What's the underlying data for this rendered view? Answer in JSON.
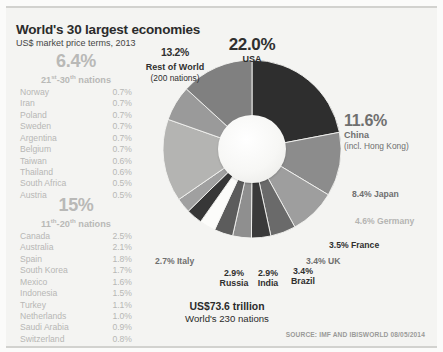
{
  "header": {
    "title": "World's 30 largest economies",
    "subtitle": "US$ market price terms, 2013"
  },
  "groups": [
    {
      "pct": "6.4%",
      "rank_prefix": "21",
      "rank_sup1": "st",
      "rank_mid": "-30",
      "rank_sup2": "th",
      "rank_suffix": " nations",
      "rows": [
        {
          "name": "Norway",
          "value": "0.7%"
        },
        {
          "name": "Iran",
          "value": "0.7%"
        },
        {
          "name": "Poland",
          "value": "0.7%"
        },
        {
          "name": "Sweden",
          "value": "0.7%"
        },
        {
          "name": "Argentina",
          "value": "0.7%"
        },
        {
          "name": "Belgium",
          "value": "0.7%"
        },
        {
          "name": "Taiwan",
          "value": "0.6%"
        },
        {
          "name": "Thailand",
          "value": "0.6%"
        },
        {
          "name": "South Africa",
          "value": "0.5%"
        },
        {
          "name": "Austria",
          "value": "0.5%"
        }
      ]
    },
    {
      "pct": "15%",
      "rank_prefix": "11",
      "rank_sup1": "th",
      "rank_mid": "-20",
      "rank_sup2": "th",
      "rank_suffix": " nations",
      "rows": [
        {
          "name": "Canada",
          "value": "2.5%"
        },
        {
          "name": "Australia",
          "value": "2.1%"
        },
        {
          "name": "Spain",
          "value": "1.8%"
        },
        {
          "name": "South Korea",
          "value": "1.7%"
        },
        {
          "name": "Mexico",
          "value": "1.6%"
        },
        {
          "name": "Indonesia",
          "value": "1.5%"
        },
        {
          "name": "Turkey",
          "value": "1.1%"
        },
        {
          "name": "Netherlands",
          "value": "1.0%"
        },
        {
          "name": "Saudi Arabia",
          "value": "0.9%"
        },
        {
          "name": "Switzerland",
          "value": "0.8%"
        }
      ]
    }
  ],
  "callouts": {
    "usa": {
      "pct": "22.0%",
      "name": "USA"
    },
    "rest_of_world": {
      "pct": "13.2%",
      "name": "Rest of World",
      "sub": "(200 nations)"
    },
    "china": {
      "pct": "11.6%",
      "name": "China",
      "sub": "(incl. Hong Kong)"
    },
    "japan": "8.4% Japan",
    "germany": "4.6% Germany",
    "france": "3.5% France",
    "uk": "3.4% UK",
    "italy": "2.7% Italy",
    "russia": {
      "pct": "2.9%",
      "name": "Russia"
    },
    "india": {
      "pct": "2.9%",
      "name": "India"
    },
    "brazil": {
      "pct": "3.4%",
      "name": "Brazil"
    }
  },
  "total": {
    "amount": "US$73.6 trillion",
    "caption": "World's 230 nations"
  },
  "source": "SOURCE: IMF AND IBISWORLD 08/05/2014",
  "colors": {
    "usa": "#2e2e2e",
    "china": "#8c8c8c",
    "japan": "#9e9e9e",
    "germany": "#6a6a6a",
    "france": "#3a3a3a",
    "uk": "#8f8f8f",
    "brazil": "#5c5c5c",
    "india": "#fcfcfa",
    "russia": "#373737",
    "italy": "#a0a0a0",
    "others_15": "#b4b4b2",
    "others_6": "#9a9a9a",
    "rest_of_world": "#808080",
    "background": "#f4f4f2",
    "title": "#2b2b2b"
  },
  "chart_data": {
    "type": "pie",
    "title": "World's 30 largest economies",
    "subtitle": "US$ market price terms, 2013",
    "unit": "% of world GDP (US$ market price terms)",
    "total": "US$73.6 trillion",
    "categories": [
      "USA",
      "China (incl. Hong Kong)",
      "Japan",
      "Germany",
      "France",
      "UK",
      "Brazil",
      "India",
      "Russia",
      "Italy",
      "11th-20th nations",
      "21st-30th nations",
      "Rest of World (200 nations)"
    ],
    "values": [
      22.0,
      11.6,
      8.4,
      4.6,
      3.5,
      3.4,
      3.4,
      2.9,
      2.9,
      2.7,
      15.0,
      6.4,
      13.2
    ],
    "legend": "labels",
    "grid": false
  }
}
